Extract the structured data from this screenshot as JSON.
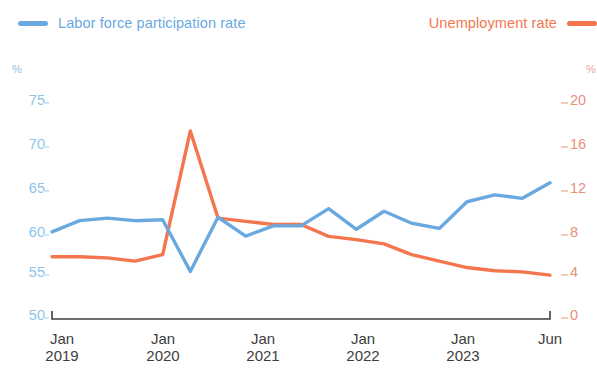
{
  "legend": {
    "series": [
      {
        "label": "Labor force participation rate",
        "color": "#6aa9e0",
        "swatch": "legend-swatch-blue",
        "align": "left"
      },
      {
        "label": "Unemployment rate",
        "color": "#f4764e",
        "swatch": "legend-swatch-orange",
        "align": "right"
      }
    ]
  },
  "axes": {
    "left": {
      "unit": "%",
      "color": "#8ec3ea",
      "ticks": [
        "75",
        "70",
        "65",
        "60",
        "55",
        "50"
      ]
    },
    "right": {
      "unit": "%",
      "color": "#f09a7c",
      "ticks": [
        "20",
        "16",
        "12",
        "8",
        "4",
        "0"
      ]
    },
    "x": {
      "color": "#3d3d3d",
      "ticks": [
        {
          "month": "Jan",
          "year": "2019"
        },
        {
          "month": "Jan",
          "year": "2020"
        },
        {
          "month": "Jan",
          "year": "2021"
        },
        {
          "month": "Jan",
          "year": "2022"
        },
        {
          "month": "Jan",
          "year": "2023"
        },
        {
          "month": "Jun",
          "year": ""
        }
      ]
    }
  },
  "chart_data": {
    "type": "line",
    "title": "",
    "subtitle": "",
    "xlabel": "",
    "grid": false,
    "legend_position": "top",
    "x": [
      "Jan 2019",
      "Apr 2019",
      "Jul 2019",
      "Oct 2019",
      "Jan 2020",
      "Apr 2020",
      "Jul 2020",
      "Oct 2020",
      "Jan 2021",
      "Apr 2021",
      "Jul 2021",
      "Oct 2021",
      "Jan 2022",
      "Apr 2022",
      "Jul 2022",
      "Oct 2022",
      "Jan 2023",
      "Apr 2023",
      "Jun 2023"
    ],
    "series": [
      {
        "name": "Labor force participation rate",
        "color": "#6aa9e0",
        "axis": "left",
        "ylabel": "%",
        "ylim": [
          50,
          75
        ],
        "yticks": [
          50,
          55,
          60,
          65,
          70,
          75
        ],
        "values": [
          59.9,
          61.2,
          61.5,
          61.2,
          61.3,
          55.3,
          61.6,
          59.4,
          60.6,
          60.6,
          62.6,
          60.2,
          62.3,
          60.9,
          60.3,
          63.4,
          64.2,
          63.8,
          65.6
        ]
      },
      {
        "name": "Unemployment rate",
        "color": "#f4764e",
        "axis": "right",
        "ylabel": "%",
        "ylim": [
          0,
          20
        ],
        "yticks": [
          0,
          4,
          8,
          12,
          16,
          20
        ],
        "values": [
          5.6,
          5.6,
          5.5,
          5.2,
          5.8,
          17.3,
          9.2,
          8.9,
          8.6,
          8.6,
          7.5,
          7.2,
          6.8,
          5.8,
          5.2,
          4.6,
          4.3,
          4.2,
          3.9
        ]
      }
    ]
  }
}
